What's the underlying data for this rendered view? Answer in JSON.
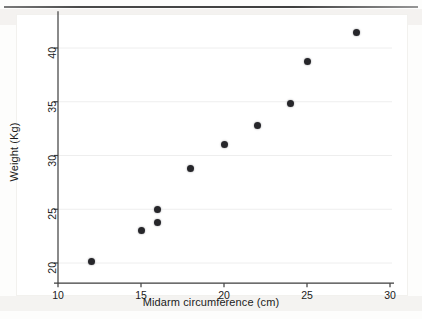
{
  "figure": {
    "background_color": "#ffffff",
    "axis_color": "#3c3c3c",
    "gridline_color": "#eeeeee",
    "marker_color": "#26262a"
  },
  "chart_data": {
    "type": "scatter",
    "title": "",
    "subtitle": "",
    "xlabel": "Midarm circumference (cm)",
    "ylabel": "Weight (Kg)",
    "xlim": [
      10,
      30
    ],
    "ylim": [
      18.5,
      42.5
    ],
    "xticks": [
      10,
      15,
      20,
      25,
      30
    ],
    "yticks": [
      20,
      25,
      30,
      35,
      40
    ],
    "xtick_labels": [
      "10",
      "15",
      "20",
      "25",
      "30"
    ],
    "ytick_labels": [
      "20",
      "25",
      "30",
      "35",
      "40"
    ],
    "grid": true,
    "grid_axis": "y",
    "legend": null,
    "legend_position": "none",
    "marker": "filled-circle",
    "series": [
      {
        "name": "observations",
        "x": [
          12,
          15,
          16,
          16,
          18,
          20,
          22,
          24,
          25,
          28
        ],
        "y": [
          20.1,
          23.0,
          23.8,
          25.0,
          28.8,
          31.0,
          32.8,
          34.8,
          38.7,
          41.4
        ]
      }
    ],
    "points": [
      {
        "x": 12,
        "y": 20.1
      },
      {
        "x": 15,
        "y": 23.0
      },
      {
        "x": 16,
        "y": 23.8
      },
      {
        "x": 16,
        "y": 25.0
      },
      {
        "x": 18,
        "y": 28.8
      },
      {
        "x": 20,
        "y": 31.0
      },
      {
        "x": 22,
        "y": 32.8
      },
      {
        "x": 24,
        "y": 34.8
      },
      {
        "x": 25,
        "y": 38.7
      },
      {
        "x": 28,
        "y": 41.4
      }
    ],
    "n_points": 10
  }
}
